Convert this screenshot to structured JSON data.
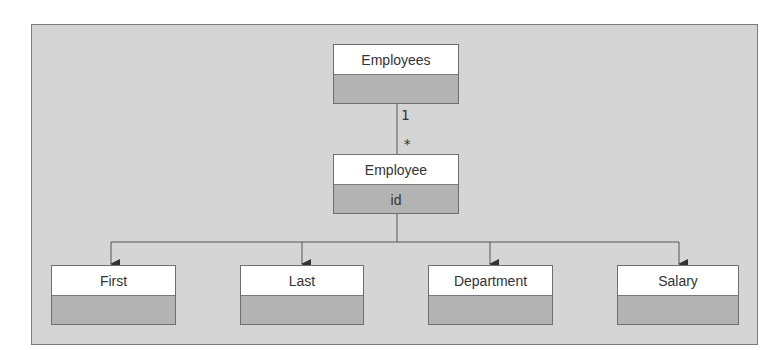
{
  "diagram": {
    "type": "uml-class-diagram",
    "colors": {
      "canvas_bg": "#d5d5d5",
      "canvas_border": "#7a7a7a",
      "class_header_bg": "#ffffff",
      "class_body_bg": "#b3b3b3",
      "line": "#555555",
      "text": "#333333"
    },
    "classes": {
      "employees": {
        "name": "Employees",
        "attributes": ""
      },
      "employee": {
        "name": "Employee",
        "attributes": "id"
      },
      "first": {
        "name": "First",
        "attributes": ""
      },
      "last": {
        "name": "Last",
        "attributes": ""
      },
      "department": {
        "name": "Department",
        "attributes": ""
      },
      "salary": {
        "name": "Salary",
        "attributes": ""
      }
    },
    "associations": [
      {
        "from": "Employees",
        "to": "Employee",
        "from_multiplicity": "1",
        "to_multiplicity": "*"
      }
    ],
    "multiplicity": {
      "source": "1",
      "target": "*"
    },
    "compositions": [
      {
        "from": "Employee",
        "to": "First"
      },
      {
        "from": "Employee",
        "to": "Last"
      },
      {
        "from": "Employee",
        "to": "Department"
      },
      {
        "from": "Employee",
        "to": "Salary"
      }
    ]
  }
}
